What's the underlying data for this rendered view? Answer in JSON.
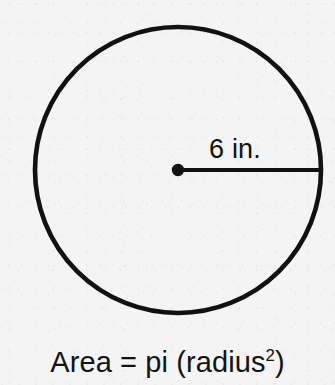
{
  "figure": {
    "shape": "circle",
    "radius_label": "6 in.",
    "caption_prefix": "Area = pi (radius",
    "caption_exponent": "2",
    "caption_suffix": ")",
    "caption_full": "Area = pi (radius2)",
    "colors": {
      "background": "#f4f4f4",
      "ink": "#111111"
    },
    "geometry": {
      "center_x": 178,
      "center_y": 170,
      "radius_px": 143,
      "stroke_width_px": 4.5,
      "center_dot_diameter_px": 12,
      "radius_line_y": 170,
      "radius_line_x_start": 178,
      "radius_line_x_end": 321
    }
  }
}
